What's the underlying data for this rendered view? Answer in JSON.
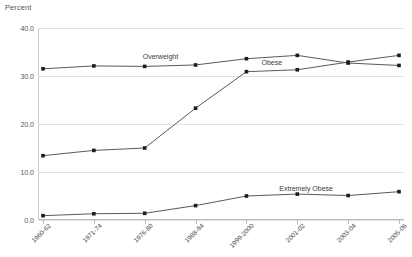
{
  "chart": {
    "type": "line",
    "title": "",
    "ylabel": "Percent",
    "xlabel": ""
  },
  "chart_data": {
    "type": "line",
    "title": "",
    "subtitle": "",
    "xlabel": "",
    "ylabel": "Percent",
    "ylim": [
      0.0,
      40.0
    ],
    "yticks": [
      0.0,
      10.0,
      20.0,
      30.0,
      40.0
    ],
    "ytick_labels": [
      "0.0",
      "10.0",
      "20.0",
      "30.0",
      "40.0"
    ],
    "grid": true,
    "legend_position": "inline-annotations",
    "categories": [
      "1960-62",
      "1971-74",
      "1976-80",
      "1988-94",
      "1999-2000",
      "2001-02",
      "2003-04",
      "2005-06"
    ],
    "series": [
      {
        "name": "Overweight",
        "values": [
          31.5,
          32.1,
          32.0,
          32.3,
          33.6,
          34.3,
          32.7,
          32.2
        ],
        "label_text": "Overweight"
      },
      {
        "name": "Obese",
        "values": [
          13.4,
          14.5,
          15.0,
          23.3,
          30.9,
          31.3,
          32.9,
          34.3
        ],
        "label_text": "Obese"
      },
      {
        "name": "Extremely Obese",
        "values": [
          0.9,
          1.3,
          1.4,
          3.0,
          5.0,
          5.4,
          5.1,
          5.9
        ],
        "label_text": "Extremely Obese"
      }
    ],
    "annotations": [
      {
        "text": "Overweight",
        "series": "Overweight"
      },
      {
        "text": "Obese",
        "series": "Obese"
      },
      {
        "text": "Extremely Obese",
        "series": "Extremely Obese"
      }
    ],
    "colors": {
      "line": "#5a5a5a",
      "marker": "#1c1c1c",
      "grid": "#e2e2e2",
      "axis": "#bdbdbd",
      "text": "#4a4a4a"
    }
  }
}
